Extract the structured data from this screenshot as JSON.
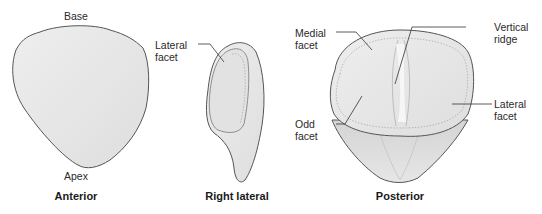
{
  "diagram": {
    "colors": {
      "bone_fill": "#e8e8e8",
      "bone_outline": "#555555",
      "facet_fill": "#dcdcdc",
      "leader_line": "#333333"
    },
    "views": [
      {
        "caption": "Anterior",
        "labels": {
          "top": "Base",
          "bottom": "Apex"
        }
      },
      {
        "caption": "Right lateral",
        "labels": {
          "facet_line1": "Lateral",
          "facet_line2": "facet"
        }
      },
      {
        "caption": "Posterior",
        "labels": {
          "medial_line1": "Medial",
          "medial_line2": "facet",
          "ridge_line1": "Vertical",
          "ridge_line2": "ridge",
          "lateral_line1": "Lateral",
          "lateral_line2": "facet",
          "odd_line1": "Odd",
          "odd_line2": "facet"
        }
      }
    ]
  }
}
